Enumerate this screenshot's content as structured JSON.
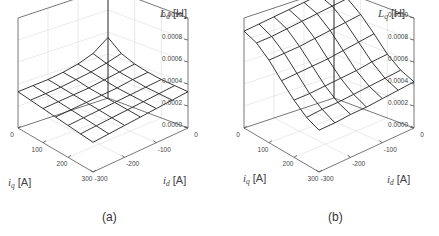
{
  "figure": {
    "panels": [
      {
        "caption": "(a)",
        "zlabel_main": "L",
        "zlabel_sub": "d",
        "zlabel_unit": "[H]",
        "xlabel_main": "i",
        "xlabel_sub": "q",
        "xlabel_unit": "[A]",
        "ylabel_main": "i",
        "ylabel_sub": "d",
        "ylabel_unit": "[A]",
        "z_ticks": [
          "0.0010",
          "0.0008",
          "0.0006",
          "0.0004",
          "0.0002",
          "0.0000"
        ],
        "iq_ticks": [
          "0",
          "100",
          "200",
          "300"
        ],
        "id_ticks": [
          "0",
          "-100",
          "-200",
          "-300"
        ]
      },
      {
        "caption": "(b)",
        "zlabel_main": "L",
        "zlabel_sub": "q",
        "zlabel_unit": "[H]",
        "xlabel_main": "i",
        "xlabel_sub": "q",
        "xlabel_unit": "[A]",
        "ylabel_main": "i",
        "ylabel_sub": "d",
        "ylabel_unit": "[A]",
        "z_ticks": [
          "0.0010",
          "0.0008",
          "0.0006",
          "0.0004",
          "0.0002",
          "0.0000"
        ],
        "iq_ticks": [
          "0",
          "100",
          "200",
          "300"
        ],
        "id_ticks": [
          "0",
          "-100",
          "-200",
          "-300"
        ]
      }
    ]
  },
  "chart_data": [
    {
      "type": "surface",
      "title": "(a)",
      "xlabel": "i_q [A]",
      "ylabel": "i_d [A]",
      "zlabel": "L_d [H]",
      "x_range": [
        0,
        300
      ],
      "y_range": [
        -300,
        0
      ],
      "z_range": [
        0.0,
        0.001
      ],
      "x": [
        0,
        50,
        100,
        150,
        200,
        250,
        300
      ],
      "y": [
        0,
        -50,
        -100,
        -150,
        -200,
        -250,
        -300
      ],
      "z": [
        [
          0.00055,
          0.00045,
          0.0004,
          0.00037,
          0.00035,
          0.00034,
          0.00033
        ],
        [
          0.00045,
          0.00041,
          0.00038,
          0.00036,
          0.00034,
          0.00033,
          0.00032
        ],
        [
          0.0004,
          0.00038,
          0.00036,
          0.00034,
          0.00033,
          0.00032,
          0.00031
        ],
        [
          0.00037,
          0.00036,
          0.00034,
          0.00033,
          0.00032,
          0.00031,
          0.0003
        ],
        [
          0.00035,
          0.00034,
          0.00033,
          0.00032,
          0.00031,
          0.0003,
          0.00029
        ],
        [
          0.00034,
          0.00033,
          0.00032,
          0.00031,
          0.0003,
          0.00029,
          0.00028
        ],
        [
          0.00033,
          0.00032,
          0.00031,
          0.0003,
          0.00029,
          0.00028,
          0.00027
        ]
      ],
      "grid": true
    },
    {
      "type": "surface",
      "title": "(b)",
      "xlabel": "i_q [A]",
      "ylabel": "i_d [A]",
      "zlabel": "L_q [H]",
      "x_range": [
        0,
        300
      ],
      "y_range": [
        -300,
        0
      ],
      "z_range": [
        0.0,
        0.001
      ],
      "x": [
        0,
        50,
        100,
        150,
        200,
        250,
        300
      ],
      "y": [
        0,
        -50,
        -100,
        -150,
        -200,
        -250,
        -300
      ],
      "z": [
        [
          0.001,
          0.00095,
          0.00085,
          0.00072,
          0.00058,
          0.00048,
          0.00042
        ],
        [
          0.00098,
          0.00093,
          0.00083,
          0.0007,
          0.00057,
          0.00047,
          0.00041
        ],
        [
          0.00096,
          0.00091,
          0.00081,
          0.00068,
          0.00055,
          0.00046,
          0.0004
        ],
        [
          0.00094,
          0.00089,
          0.00079,
          0.00066,
          0.00054,
          0.00045,
          0.00039
        ],
        [
          0.00092,
          0.00087,
          0.00077,
          0.00065,
          0.00053,
          0.00044,
          0.00039
        ],
        [
          0.0009,
          0.00085,
          0.00076,
          0.00064,
          0.00052,
          0.00044,
          0.00038
        ],
        [
          0.00088,
          0.00084,
          0.00075,
          0.00063,
          0.00052,
          0.00043,
          0.00038
        ]
      ],
      "grid": true
    }
  ]
}
